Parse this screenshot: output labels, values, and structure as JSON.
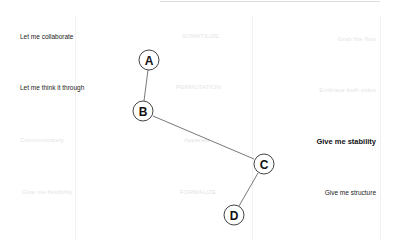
{
  "rows": [
    {
      "left": "Let me collaborate",
      "middle": "SOMATILIZE",
      "right": "Grab the flow"
    },
    {
      "left": "Let me think it through",
      "middle": "PERMUTATION",
      "right": "Embrace both sides"
    },
    {
      "left": "Communicately",
      "middle": "Apparate",
      "right": "Give me stability"
    },
    {
      "left": "Give me flexibility",
      "middle": "FORMALIZE",
      "right": "Give me structure"
    }
  ],
  "nodes": [
    {
      "id": "A",
      "label": "A"
    },
    {
      "id": "B",
      "label": "B"
    },
    {
      "id": "C",
      "label": "C"
    },
    {
      "id": "D",
      "label": "D"
    }
  ],
  "edges": [
    {
      "from": "A",
      "to": "B"
    },
    {
      "from": "B",
      "to": "C"
    },
    {
      "from": "C",
      "to": "D"
    }
  ]
}
